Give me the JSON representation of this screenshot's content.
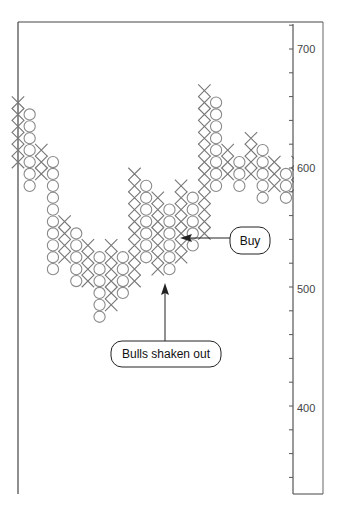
{
  "chart_data": {
    "type": "point-and-figure",
    "title": "",
    "xlabel": "",
    "ylabel": "",
    "box_size": 10,
    "ylim": [
      325,
      720
    ],
    "y_ticks": [
      700,
      600,
      500,
      400
    ],
    "y_minor_tick_step": 20,
    "grid": false,
    "axis_position": "right",
    "columns": [
      {
        "type": "X",
        "from": 605,
        "to": 655,
        "partial": true
      },
      {
        "type": "O",
        "from": 645,
        "to": 585
      },
      {
        "type": "X",
        "from": 595,
        "to": 615
      },
      {
        "type": "O",
        "from": 605,
        "to": 515
      },
      {
        "type": "X",
        "from": 525,
        "to": 555
      },
      {
        "type": "O",
        "from": 545,
        "to": 505
      },
      {
        "type": "X",
        "from": 505,
        "to": 535
      },
      {
        "type": "O",
        "from": 525,
        "to": 475
      },
      {
        "type": "X",
        "from": 485,
        "to": 535
      },
      {
        "type": "O",
        "from": 525,
        "to": 495
      },
      {
        "type": "X",
        "from": 505,
        "to": 595
      },
      {
        "type": "O",
        "from": 585,
        "to": 525
      },
      {
        "type": "X",
        "from": 515,
        "to": 575
      },
      {
        "type": "O",
        "from": 565,
        "to": 515
      },
      {
        "type": "X",
        "from": 525,
        "to": 585
      },
      {
        "type": "O",
        "from": 575,
        "to": 535
      },
      {
        "type": "X",
        "from": 545,
        "to": 665
      },
      {
        "type": "O",
        "from": 655,
        "to": 585
      },
      {
        "type": "X",
        "from": 595,
        "to": 615
      },
      {
        "type": "O",
        "from": 605,
        "to": 585
      },
      {
        "type": "X",
        "from": 595,
        "to": 625
      },
      {
        "type": "O",
        "from": 615,
        "to": 575
      },
      {
        "type": "X",
        "from": 585,
        "to": 605
      },
      {
        "type": "O",
        "from": 595,
        "to": 575
      },
      {
        "type": "X",
        "from": 585,
        "to": 605,
        "partial": true
      }
    ],
    "annotations": [
      {
        "text": "Buy",
        "points_to": {
          "column": 16,
          "price": 545
        }
      },
      {
        "text": "Bulls shaken out",
        "points_to": {
          "column": 13,
          "price": 515
        }
      }
    ]
  },
  "axis": {
    "labels": [
      "700",
      "600",
      "500",
      "400"
    ]
  },
  "callouts": {
    "buy": "Buy",
    "bulls": "Bulls shaken out"
  },
  "colors": {
    "symbol": "#8a8a8a",
    "axis": "#555555",
    "frame": "#444444",
    "callout_border": "#222222",
    "arrow": "#222222"
  }
}
